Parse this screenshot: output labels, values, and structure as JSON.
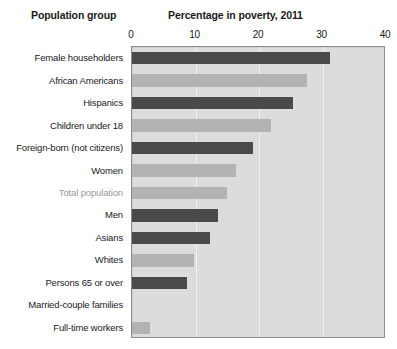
{
  "headers": {
    "left": "Population group",
    "right": "Percentage in poverty, 2011"
  },
  "chart_data": {
    "type": "bar",
    "orientation": "horizontal",
    "title": "Percentage in poverty, 2011",
    "xlabel": "Percentage in poverty, 2011",
    "ylabel": "Population group",
    "xlim": [
      0,
      40
    ],
    "ticks": [
      "0",
      "10",
      "20",
      "30",
      "40"
    ],
    "tick_values": [
      0,
      10,
      20,
      30,
      40
    ],
    "grid": true,
    "legend": "none",
    "plot_background": "#dcdcdc",
    "bar_color_dark": "#4a4a4a",
    "bar_color_light": "#b3b3b3",
    "highlight_label_color": "#9a9a9a",
    "categories": [
      "Female householders",
      "African Americans",
      "Hispanics",
      "Children under 18",
      "Foreign-born (not citizens)",
      "Women",
      "Total population",
      "Men",
      "Asians",
      "Whites",
      "Persons 65 or over",
      "Married-couple families",
      "Full-time workers"
    ],
    "values": [
      31.2,
      27.6,
      25.3,
      21.9,
      19.0,
      16.3,
      15.0,
      13.6,
      12.3,
      9.8,
      8.7,
      0.0,
      2.8
    ],
    "bar_shades": [
      "dark",
      "light",
      "dark",
      "light",
      "dark",
      "light",
      "light",
      "dark",
      "dark",
      "light",
      "dark",
      "light",
      "light"
    ],
    "emphasized_category": "Total population"
  }
}
